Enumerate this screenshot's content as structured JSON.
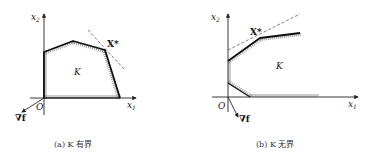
{
  "panels": [
    {
      "id": "a",
      "caption": "(a) K 有界",
      "x_axis_label": "x",
      "x_axis_sub": "1",
      "y_axis_label": "x",
      "y_axis_sub": "2",
      "origin_label": "O",
      "region_label": "K",
      "optimum_label": "X*",
      "gradient_label": "∇f"
    },
    {
      "id": "b",
      "caption": "(b) K 无界",
      "x_axis_label": "x",
      "x_axis_sub": "1",
      "y_axis_label": "x",
      "y_axis_sub": "2",
      "origin_label": "O",
      "region_label": "K",
      "optimum_label": "X*",
      "gradient_label": "∇f"
    }
  ]
}
